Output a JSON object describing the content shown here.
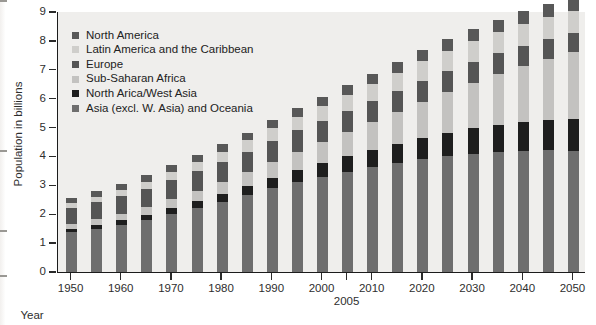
{
  "chart_data": {
    "type": "bar",
    "subtype": "stacked-bar",
    "title": "",
    "xlabel": "Year",
    "ylabel": "Population in billions",
    "ylim": [
      0,
      9
    ],
    "y_ticks": [
      0,
      1,
      2,
      3,
      4,
      5,
      6,
      7,
      8,
      9
    ],
    "x_ticks": [
      "1950",
      "1960",
      "1970",
      "1980",
      "1990",
      "2000",
      "2010",
      "2020",
      "2030",
      "2040",
      "2050"
    ],
    "x_extra_tick": "2005",
    "grid": false,
    "legend_position": "upper-left inside plot",
    "categories": [
      "1950",
      "1955",
      "1960",
      "1965",
      "1970",
      "1975",
      "1980",
      "1985",
      "1990",
      "1995",
      "2000",
      "2005",
      "2010",
      "2015",
      "2020",
      "2025",
      "2030",
      "2035",
      "2040",
      "2045",
      "2050"
    ],
    "series": [
      {
        "name": "Asia (excl. W. Asia) and Oceania",
        "color": "#6e6e6e",
        "values": [
          1.38,
          1.5,
          1.64,
          1.81,
          2.01,
          2.23,
          2.44,
          2.66,
          2.9,
          3.11,
          3.3,
          3.47,
          3.62,
          3.77,
          3.9,
          4.01,
          4.1,
          4.16,
          4.2,
          4.21,
          4.2
        ]
      },
      {
        "name": "North Arica/West Asia",
        "color": "#1e1e1e",
        "values": [
          0.11,
          0.13,
          0.15,
          0.17,
          0.2,
          0.23,
          0.27,
          0.31,
          0.36,
          0.41,
          0.47,
          0.53,
          0.59,
          0.66,
          0.73,
          0.8,
          0.87,
          0.94,
          1.0,
          1.06,
          1.11
        ]
      },
      {
        "name": "Sub-Saharan Africa",
        "color": "#c3c2c0",
        "values": [
          0.18,
          0.21,
          0.23,
          0.27,
          0.31,
          0.35,
          0.41,
          0.48,
          0.56,
          0.65,
          0.74,
          0.85,
          0.97,
          1.1,
          1.25,
          1.41,
          1.58,
          1.76,
          1.94,
          2.12,
          2.29
        ]
      },
      {
        "name": "Europe",
        "color": "#555555",
        "values": [
          0.55,
          0.58,
          0.6,
          0.63,
          0.66,
          0.68,
          0.69,
          0.71,
          0.72,
          0.73,
          0.73,
          0.73,
          0.74,
          0.74,
          0.74,
          0.73,
          0.72,
          0.71,
          0.7,
          0.68,
          0.67
        ]
      },
      {
        "name": "Latin America and the Caribbean",
        "color": "#cfcecb",
        "values": [
          0.17,
          0.19,
          0.22,
          0.25,
          0.29,
          0.33,
          0.36,
          0.4,
          0.44,
          0.48,
          0.52,
          0.56,
          0.6,
          0.63,
          0.67,
          0.7,
          0.72,
          0.74,
          0.75,
          0.76,
          0.76
        ]
      },
      {
        "name": "North America",
        "color": "#585858",
        "values": [
          0.17,
          0.19,
          0.2,
          0.22,
          0.23,
          0.24,
          0.25,
          0.27,
          0.28,
          0.3,
          0.31,
          0.33,
          0.35,
          0.36,
          0.38,
          0.4,
          0.41,
          0.43,
          0.44,
          0.45,
          0.46
        ]
      }
    ],
    "totals": [
      2.56,
      2.8,
      3.04,
      3.35,
      3.7,
      4.06,
      4.42,
      4.83,
      5.26,
      5.68,
      6.07,
      6.47,
      6.87,
      7.26,
      7.67,
      8.05,
      8.4,
      8.74,
      9.03,
      9.28,
      9.49
    ]
  },
  "legend": {
    "items": [
      {
        "label": "North America",
        "color": "#585858"
      },
      {
        "label": "Latin America and the Caribbean",
        "color": "#cfcecb"
      },
      {
        "label": "Europe",
        "color": "#555555"
      },
      {
        "label": "Sub-Saharan Africa",
        "color": "#c3c2c0"
      },
      {
        "label": "North Arica/West Asia",
        "color": "#1e1e1e"
      },
      {
        "label": "Asia (excl. W. Asia) and Oceania",
        "color": "#6e6e6e"
      }
    ]
  },
  "axes": {
    "y_title": "Population in billions",
    "x_title": "Year"
  }
}
